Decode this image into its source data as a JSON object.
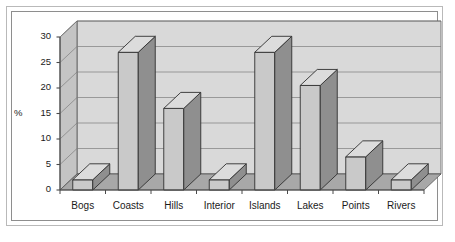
{
  "chart_data": {
    "type": "bar",
    "title": "",
    "subtitle": "",
    "xlabel": "",
    "ylabel": "%",
    "categories": [
      "Bogs",
      "Coasts",
      "Hills",
      "Interior",
      "Islands",
      "Lakes",
      "Points",
      "Rivers"
    ],
    "values": [
      2,
      27,
      16,
      2,
      27,
      20.5,
      6.5,
      2
    ],
    "series": [
      {
        "name": "",
        "values": [
          2,
          27,
          16,
          2,
          27,
          20.5,
          6.5,
          2
        ]
      }
    ],
    "ylim": [
      0,
      30
    ],
    "yticks": [
      0,
      5,
      10,
      15,
      20,
      25,
      30
    ],
    "ytick_labels": [
      "0",
      "5",
      "10",
      "15",
      "20",
      "25",
      "30"
    ],
    "grid": true,
    "grid_axis": "y",
    "legend": false,
    "legend_position": "none",
    "style": "3d",
    "annotations": []
  },
  "colors": {
    "bar_front": "#c9c9c9",
    "bar_side": "#8f8f8f",
    "bar_top": "#dcdcdc",
    "bar_edge": "#303030",
    "wall_back": "#d9d9d9",
    "wall_side": "#c4c4c4",
    "floor": "#a8a8a8",
    "gridline": "#7d7d7d",
    "axis": "#4a4a4a",
    "text": "#1a1a1a",
    "frame_outer": "#b9b9b9",
    "frame_inner": "#8e8e8e",
    "page_background": "#ffffff"
  }
}
